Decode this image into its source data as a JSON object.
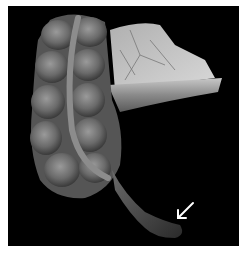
{
  "figure": {
    "background_color": "#000000",
    "border_color": "#ffffff",
    "annotation": {
      "type": "arrow",
      "color": "#ffffff",
      "points_to": "appendix-tip"
    }
  }
}
